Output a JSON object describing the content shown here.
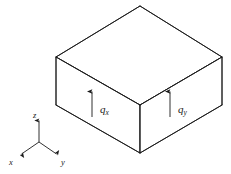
{
  "figure": {
    "type": "isometric-box-diagram",
    "background_color": "#ffffff",
    "line_color": "#1a1a1a",
    "fill_color": "#ffffff"
  },
  "box": {
    "name": "control-volume",
    "vertices": {
      "top_back": [
        140,
        6
      ],
      "top_left": [
        56,
        57
      ],
      "top_right": [
        222,
        57
      ],
      "top_front": [
        140,
        105
      ],
      "bottom_left": [
        56,
        105
      ],
      "bottom_right": [
        222,
        105
      ],
      "bottom_front": [
        140,
        153
      ]
    },
    "faces": [
      "top",
      "left-front",
      "right-front"
    ]
  },
  "flux_arrows": [
    {
      "id": "flux-arrow-x",
      "symbol": "q",
      "subscript": "x",
      "face": "left-front",
      "direction": "up",
      "tail": [
        92,
        117
      ],
      "head": [
        92,
        90
      ],
      "label_position": [
        100,
        112
      ]
    },
    {
      "id": "flux-arrow-y",
      "symbol": "q",
      "subscript": "y",
      "face": "right-front",
      "direction": "up",
      "tail": [
        170,
        117
      ],
      "head": [
        170,
        90
      ],
      "label_position": [
        178,
        112
      ]
    }
  ],
  "axes": {
    "name": "coordinate-triad",
    "origin": [
      39,
      142
    ],
    "items": [
      {
        "id": "axis-z",
        "label": "z",
        "direction": "up",
        "tip": [
          39,
          119
        ],
        "label_position": [
          35,
          116
        ]
      },
      {
        "id": "axis-x",
        "label": "x",
        "direction": "down-left",
        "tip": [
          20,
          155
        ],
        "label_position": [
          10,
          163
        ]
      },
      {
        "id": "axis-y",
        "label": "y",
        "direction": "down-right",
        "tip": [
          58,
          155
        ],
        "label_position": [
          62,
          163
        ]
      }
    ]
  }
}
